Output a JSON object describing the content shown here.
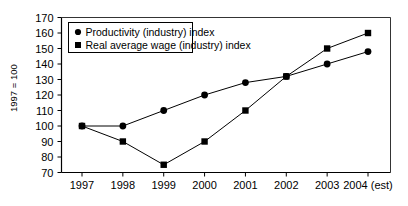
{
  "chart_data": {
    "type": "line",
    "title": "",
    "xlabel": "",
    "ylabel": "1997 = 100",
    "categories": [
      "1997",
      "1998",
      "1999",
      "2000",
      "2001",
      "2002",
      "2003",
      "2004 (est)"
    ],
    "xticklabels": [
      "1997",
      "1998",
      "1999",
      "2000",
      "2001",
      "2002",
      "2003",
      "2004 (est)"
    ],
    "yticklabels": [
      "70",
      "80",
      "90",
      "100",
      "110",
      "120",
      "130",
      "140",
      "150",
      "160",
      "170"
    ],
    "ytickvalues": [
      70,
      80,
      90,
      100,
      110,
      120,
      130,
      140,
      150,
      160,
      170
    ],
    "ylim": [
      70,
      170
    ],
    "grid": false,
    "legend_position": "top-left",
    "series": [
      {
        "name": "Productivity (industry) index",
        "marker": "circle",
        "color": "#000000",
        "values": [
          100,
          100,
          110,
          120,
          128,
          132,
          140,
          148
        ]
      },
      {
        "name": "Real average wage (industry) index",
        "marker": "square",
        "color": "#000000",
        "values": [
          100,
          90,
          75,
          90,
          110,
          132,
          150,
          160
        ]
      }
    ]
  },
  "legend": {
    "items": [
      {
        "label": "Productivity (industry) index",
        "marker": "circle"
      },
      {
        "label": "Real average wage (industry) index",
        "marker": "square"
      }
    ]
  },
  "colors": {
    "line": "#000000",
    "marker": "#000000",
    "axis": "#000000",
    "background": "#ffffff"
  }
}
